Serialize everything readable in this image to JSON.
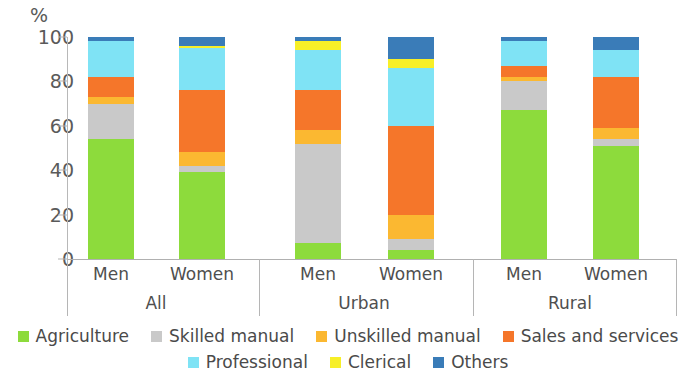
{
  "axis": {
    "unit_label": "%",
    "y_ticks": [
      "0",
      "20",
      "40",
      "60",
      "80",
      "100"
    ],
    "y_min": 0,
    "y_max": 100
  },
  "groups": [
    {
      "name": "All",
      "bars": [
        "Men",
        "Women"
      ]
    },
    {
      "name": "Urban",
      "bars": [
        "Men",
        "Women"
      ]
    },
    {
      "name": "Rural",
      "bars": [
        "Men",
        "Women"
      ]
    }
  ],
  "legend": {
    "row1": [
      "Agriculture",
      "Skilled manual",
      "Unskilled manual",
      "Sales and services"
    ],
    "row2": [
      "Professional",
      "Clerical",
      "Others"
    ]
  },
  "colors": {
    "agriculture": "#8ddb3c",
    "skilled_manual": "#c9c9c9",
    "unskilled_manual": "#fbb831",
    "sales_and_services": "#f5762a",
    "professional": "#7fe3f5",
    "clerical": "#f7ef28",
    "others": "#3a7cb8"
  },
  "chart_data": {
    "type": "bar",
    "title": "",
    "subtitle": "",
    "xlabel": "",
    "ylabel": "%",
    "ylim": [
      0,
      100
    ],
    "grid": false,
    "stacked": true,
    "legend_position": "bottom",
    "categories": [
      "All / Men",
      "All / Women",
      "Urban / Men",
      "Urban / Women",
      "Rural / Men",
      "Rural / Women"
    ],
    "series": [
      {
        "name": "Agriculture",
        "color": "#8ddb3c",
        "values": [
          54,
          39,
          7,
          4,
          67,
          51
        ]
      },
      {
        "name": "Skilled manual",
        "color": "#c9c9c9",
        "values": [
          16,
          3,
          45,
          5,
          13,
          3
        ]
      },
      {
        "name": "Unskilled manual",
        "color": "#fbb831",
        "values": [
          3,
          6,
          6,
          11,
          2,
          5
        ]
      },
      {
        "name": "Sales and services",
        "color": "#f5762a",
        "values": [
          9,
          28,
          18,
          40,
          5,
          23
        ]
      },
      {
        "name": "Professional",
        "color": "#7fe3f5",
        "values": [
          16,
          19,
          18,
          26,
          11,
          12
        ]
      },
      {
        "name": "Clerical",
        "color": "#f7ef28",
        "values": [
          0,
          1,
          4,
          4,
          0,
          0
        ]
      },
      {
        "name": "Others",
        "color": "#3a7cb8",
        "values": [
          2,
          4,
          2,
          10,
          2,
          6
        ]
      }
    ]
  }
}
